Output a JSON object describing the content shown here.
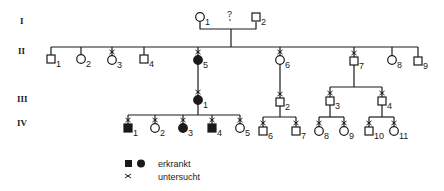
{
  "colors": {
    "ink": "#1a1a1a",
    "background": "#ffffff"
  },
  "generations": [
    {
      "label": "I",
      "y": 22
    },
    {
      "label": "II",
      "y": 52
    },
    {
      "label": "III",
      "y": 100
    },
    {
      "label": "IV",
      "y": 123
    }
  ],
  "individuals": [
    {
      "id": "I-1",
      "gen": "I",
      "num": "1",
      "sex": "female",
      "affected": false,
      "examined": false,
      "x": 200,
      "y": 17
    },
    {
      "id": "I-2",
      "gen": "I",
      "num": "2",
      "sex": "male",
      "affected": false,
      "examined": false,
      "x": 256,
      "y": 17
    },
    {
      "id": "II-1",
      "gen": "II",
      "num": "1",
      "sex": "male",
      "affected": false,
      "examined": false,
      "x": 51,
      "y": 59
    },
    {
      "id": "II-2",
      "gen": "II",
      "num": "2",
      "sex": "female",
      "affected": false,
      "examined": false,
      "x": 81,
      "y": 59
    },
    {
      "id": "II-3",
      "gen": "II",
      "num": "3",
      "sex": "female",
      "affected": false,
      "examined": true,
      "x": 112,
      "y": 60
    },
    {
      "id": "II-4",
      "gen": "II",
      "num": "4",
      "sex": "male",
      "affected": false,
      "examined": false,
      "x": 144,
      "y": 59
    },
    {
      "id": "II-5",
      "gen": "II",
      "num": "5",
      "sex": "female",
      "affected": true,
      "examined": true,
      "x": 198,
      "y": 60
    },
    {
      "id": "II-6",
      "gen": "II",
      "num": "6",
      "sex": "female",
      "affected": false,
      "examined": true,
      "x": 280,
      "y": 60
    },
    {
      "id": "II-7",
      "gen": "II",
      "num": "7",
      "sex": "male",
      "affected": false,
      "examined": true,
      "x": 354,
      "y": 61
    },
    {
      "id": "II-8",
      "gen": "II",
      "num": "8",
      "sex": "female",
      "affected": false,
      "examined": false,
      "x": 392,
      "y": 60
    },
    {
      "id": "II-9",
      "gen": "II",
      "num": "9",
      "sex": "male",
      "affected": false,
      "examined": false,
      "x": 418,
      "y": 61
    },
    {
      "id": "III-1",
      "gen": "III",
      "num": "1",
      "sex": "female",
      "affected": true,
      "examined": true,
      "x": 198,
      "y": 100
    },
    {
      "id": "III-2",
      "gen": "III",
      "num": "2",
      "sex": "male",
      "affected": false,
      "examined": true,
      "x": 280,
      "y": 102
    },
    {
      "id": "III-3",
      "gen": "III",
      "num": "3",
      "sex": "male",
      "affected": false,
      "examined": true,
      "x": 330,
      "y": 101
    },
    {
      "id": "III-4",
      "gen": "III",
      "num": "4",
      "sex": "male",
      "affected": false,
      "examined": true,
      "x": 382,
      "y": 101
    },
    {
      "id": "IV-1",
      "gen": "IV",
      "num": "1",
      "sex": "male",
      "affected": true,
      "examined": true,
      "x": 128,
      "y": 128
    },
    {
      "id": "IV-2",
      "gen": "IV",
      "num": "2",
      "sex": "female",
      "affected": false,
      "examined": true,
      "x": 155,
      "y": 128
    },
    {
      "id": "IV-3",
      "gen": "IV",
      "num": "3",
      "sex": "female",
      "affected": true,
      "examined": true,
      "x": 183,
      "y": 128
    },
    {
      "id": "IV-4",
      "gen": "IV",
      "num": "4",
      "sex": "male",
      "affected": true,
      "examined": true,
      "x": 212,
      "y": 128
    },
    {
      "id": "IV-5",
      "gen": "IV",
      "num": "5",
      "sex": "female",
      "affected": false,
      "examined": true,
      "x": 240,
      "y": 128
    },
    {
      "id": "IV-6",
      "gen": "IV",
      "num": "6",
      "sex": "male",
      "affected": false,
      "examined": true,
      "x": 263,
      "y": 131
    },
    {
      "id": "IV-7",
      "gen": "IV",
      "num": "7",
      "sex": "male",
      "affected": false,
      "examined": true,
      "x": 296,
      "y": 131
    },
    {
      "id": "IV-8",
      "gen": "IV",
      "num": "8",
      "sex": "female",
      "affected": false,
      "examined": true,
      "x": 319,
      "y": 131
    },
    {
      "id": "IV-9",
      "gen": "IV",
      "num": "9",
      "sex": "female",
      "affected": false,
      "examined": true,
      "x": 344,
      "y": 131
    },
    {
      "id": "IV-10",
      "gen": "IV",
      "num": "10",
      "sex": "male",
      "affected": false,
      "examined": true,
      "x": 369,
      "y": 131
    },
    {
      "id": "IV-11",
      "gen": "IV",
      "num": "11",
      "sex": "female",
      "affected": false,
      "examined": true,
      "x": 394,
      "y": 131
    }
  ],
  "annotations": {
    "parent_uncertain": "?"
  },
  "legend": {
    "affected_label": "erkrankt",
    "examined_label": "untersucht",
    "examined_symbol": "×"
  }
}
